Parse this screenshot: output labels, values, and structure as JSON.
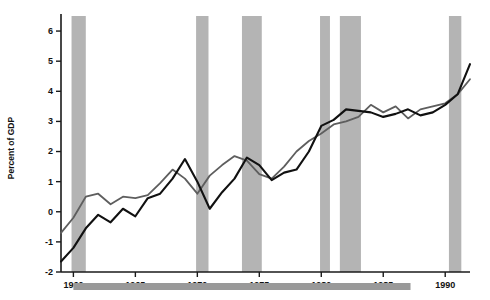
{
  "chart_data": {
    "type": "line",
    "title": "",
    "subtitle": "",
    "xlabel": "",
    "ylabel": "Percent of GDP",
    "xlim": [
      1959,
      1992
    ],
    "ylim": [
      -2,
      6.5
    ],
    "yticks": [
      -2,
      -1,
      0,
      1,
      2,
      3,
      4,
      5,
      6
    ],
    "ytick_labels": [
      "-2",
      "-1",
      "0",
      "1",
      "2",
      "3",
      "4",
      "5",
      "6"
    ],
    "xticks": [
      1960,
      1965,
      1970,
      1975,
      1980,
      1985,
      1990
    ],
    "xtick_labels": [
      "1960",
      "1965",
      "1970",
      "1975",
      "1980",
      "1985",
      "1990"
    ],
    "grid": false,
    "legend": null,
    "x": [
      1959,
      1960,
      1961,
      1962,
      1963,
      1964,
      1965,
      1966,
      1967,
      1968,
      1969,
      1970,
      1971,
      1972,
      1973,
      1974,
      1975,
      1976,
      1977,
      1978,
      1979,
      1980,
      1981,
      1982,
      1983,
      1984,
      1985,
      1986,
      1987,
      1988,
      1989,
      1990,
      1991,
      1992
    ],
    "series": [
      {
        "name": "series-black",
        "color": "#111111",
        "values": [
          -1.65,
          -1.2,
          -0.55,
          -0.1,
          -0.35,
          0.1,
          -0.15,
          0.45,
          0.6,
          1.1,
          1.75,
          1.0,
          0.1,
          0.65,
          1.1,
          1.8,
          1.55,
          1.05,
          1.3,
          1.4,
          2.0,
          2.85,
          3.05,
          3.4,
          3.35,
          3.3,
          3.15,
          3.25,
          3.4,
          3.2,
          3.3,
          3.55,
          3.9,
          4.9
        ]
      },
      {
        "name": "series-gray",
        "color": "#5e5e5e",
        "values": [
          -0.7,
          -0.2,
          0.5,
          0.6,
          0.25,
          0.5,
          0.45,
          0.55,
          0.95,
          1.4,
          1.1,
          0.6,
          1.2,
          1.55,
          1.85,
          1.7,
          1.25,
          1.1,
          1.5,
          2.0,
          2.35,
          2.6,
          2.9,
          3.0,
          3.15,
          3.55,
          3.3,
          3.5,
          3.1,
          3.4,
          3.5,
          3.6,
          3.9,
          4.4
        ]
      }
    ],
    "recession_bands": [
      {
        "start": 1959.85,
        "end": 1961.0
      },
      {
        "start": 1969.9,
        "end": 1970.9
      },
      {
        "start": 1973.6,
        "end": 1975.2
      },
      {
        "start": 1979.9,
        "end": 1980.7
      },
      {
        "start": 1981.5,
        "end": 1983.2
      },
      {
        "start": 1990.3,
        "end": 1991.3
      }
    ],
    "footer_bar": {
      "start": 1960.0,
      "end": 1987.2,
      "color": "#999999"
    },
    "band_color": "#b4b4b4"
  }
}
